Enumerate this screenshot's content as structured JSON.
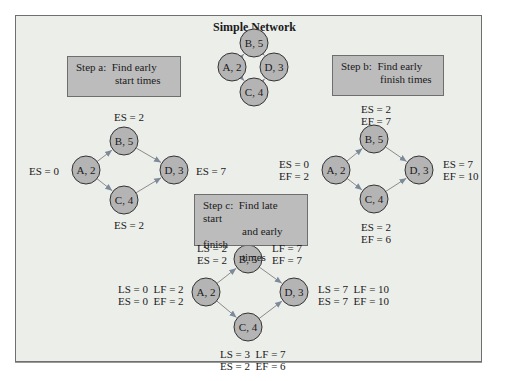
{
  "title": "Simple Network",
  "steps": {
    "a": {
      "label": "Step a:",
      "line1": "Find early",
      "line2": "start times"
    },
    "b": {
      "label": "Step b:",
      "line1": "Find early",
      "line2": "finish times"
    },
    "c": {
      "label": "Step c:",
      "line1": "Find late start",
      "line2": "and early finish",
      "line3": "times"
    }
  },
  "nodes": {
    "A": "A, 2",
    "B": "B, 5",
    "C": "C, 4",
    "D": "D, 3"
  },
  "colors": {
    "node_fill": "#b4b4b4",
    "background": "#eceeea",
    "box_fill": "#bcbcbc",
    "arrow": "#8a8a8a"
  },
  "diagram_a": {
    "A": "ES = 0",
    "B": "ES = 2",
    "C": "ES = 2",
    "D": "ES = 7"
  },
  "diagram_b": {
    "A1": "ES = 0",
    "A2": "EF = 2",
    "B1": "ES = 2",
    "B2": "EF = 7",
    "C1": "ES = 2",
    "C2": "EF = 6",
    "D1": "ES = 7",
    "D2": "EF = 10"
  },
  "diagram_c": {
    "A1": "LS = 0  LF = 2",
    "A2": "ES = 0  EF = 2",
    "B_left1": "LS = 2",
    "B_left2": "ES = 2",
    "B_right1": "LF = 7",
    "B_right2": "EF = 7",
    "C1": "LS = 3  LF = 7",
    "C2": "ES = 2  EF = 6",
    "D1": "LS = 7  LF = 10",
    "D2": "ES = 7  EF = 10"
  }
}
